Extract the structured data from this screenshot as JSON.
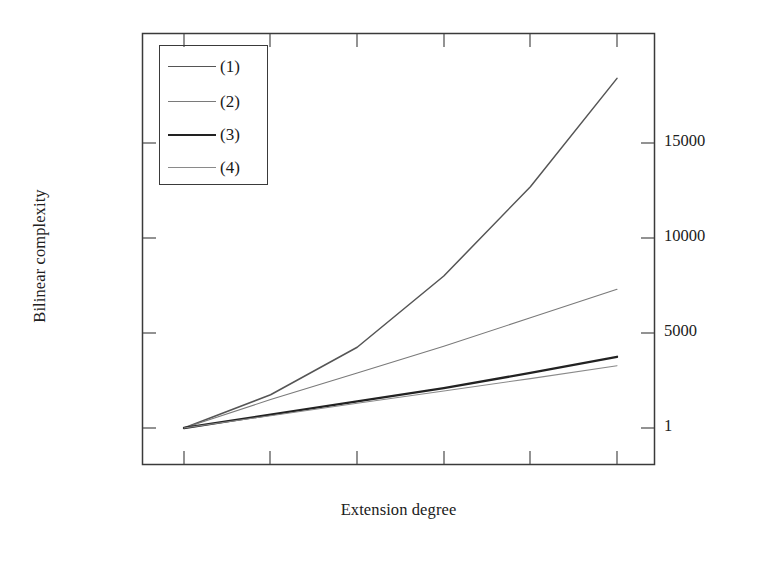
{
  "figure": {
    "ylabel": "Bilinear complexity",
    "xlabel": "Extension degree",
    "legend": {
      "entries": [
        {
          "label": "(1)",
          "color": "#555555",
          "width": 1.5
        },
        {
          "label": "(2)",
          "color": "#7a7a7a",
          "width": 1.1
        },
        {
          "label": "(3)",
          "color": "#222222",
          "width": 2.3
        },
        {
          "label": "(4)",
          "color": "#8a8a8a",
          "width": 1.1
        }
      ]
    }
  },
  "chart_data": {
    "type": "line",
    "title": "",
    "xlabel": "Extension degree",
    "ylabel": "Bilinear complexity",
    "ylim": [
      1,
      19000
    ],
    "xlim": [
      0,
      6
    ],
    "grid": false,
    "legend_position": "top-left",
    "yticks": [
      1,
      5000,
      10000,
      15000
    ],
    "ytick_labels": [
      "1",
      "5000",
      "10000",
      "15000"
    ],
    "xticks": [
      1,
      2,
      3,
      4,
      5,
      6
    ],
    "xtick_labels": [
      "",
      "",
      "",
      "",
      "",
      ""
    ],
    "x": [
      1,
      2,
      3,
      4,
      5,
      6
    ],
    "series": [
      {
        "name": "(1)",
        "values": [
          1,
          1750,
          4250,
          8000,
          12700,
          18400
        ],
        "color": "#555555",
        "linewidth": 1.5
      },
      {
        "name": "(2)",
        "values": [
          1,
          1500,
          2900,
          4300,
          5800,
          7300
        ],
        "color": "#7a7a7a",
        "linewidth": 1.1
      },
      {
        "name": "(3)",
        "values": [
          1,
          700,
          1400,
          2100,
          2900,
          3750
        ],
        "color": "#222222",
        "linewidth": 2.3
      },
      {
        "name": "(4)",
        "values": [
          1,
          650,
          1300,
          1950,
          2600,
          3280
        ],
        "color": "#8a8a8a",
        "linewidth": 1.1
      }
    ]
  },
  "axes": {
    "frame_color": "#3a3a3a",
    "tick_color": "#4a4a4a"
  }
}
